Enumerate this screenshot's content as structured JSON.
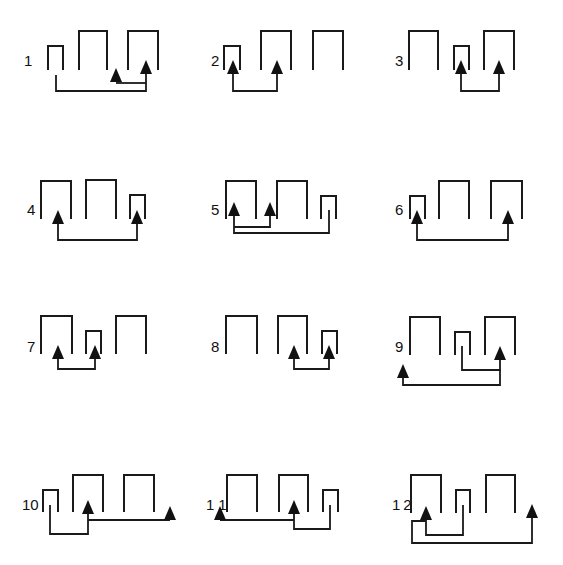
{
  "figure": {
    "title": "",
    "panels": [
      {
        "label": "1"
      },
      {
        "label": "2"
      },
      {
        "label": "3"
      },
      {
        "label": "4"
      },
      {
        "label": "5"
      },
      {
        "label": "6"
      },
      {
        "label": "7"
      },
      {
        "label": "8"
      },
      {
        "label": "9"
      },
      {
        "label": "10"
      },
      {
        "label": "11"
      },
      {
        "label": "12"
      }
    ]
  },
  "colors": {
    "ink": "#1a1a1a",
    "background": "#ffffff"
  }
}
